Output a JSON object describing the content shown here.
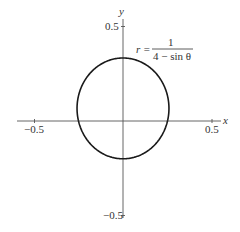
{
  "chart_data": {
    "type": "line",
    "subtype": "polar-curve",
    "title": "",
    "equation": {
      "lhs": "r =",
      "numerator": "1",
      "denominator": "4 − sin θ"
    },
    "xlabel": "x",
    "ylabel": "y",
    "xlim": [
      -0.6,
      0.55
    ],
    "ylim": [
      -0.52,
      0.55
    ],
    "x_ticks": [
      {
        "value": -0.5,
        "label": "−0.5"
      },
      {
        "value": 0.5,
        "label": "0.5"
      }
    ],
    "y_ticks": [
      {
        "value": 0.5,
        "label": "0.5"
      },
      {
        "value": -0.5,
        "label": "−0.5"
      }
    ],
    "grid": false,
    "legend": null,
    "series": [
      {
        "name": "r = 1/(4 − sin θ)",
        "color": "#1a1a1a",
        "key_points": [
          {
            "theta_deg": 0,
            "r": 0.25,
            "x": 0.25,
            "y": 0.0
          },
          {
            "theta_deg": 90,
            "r": 0.3333,
            "x": 0.0,
            "y": 0.3333
          },
          {
            "theta_deg": 180,
            "r": 0.25,
            "x": -0.25,
            "y": 0.0
          },
          {
            "theta_deg": 270,
            "r": 0.2,
            "x": 0.0,
            "y": -0.2
          }
        ]
      }
    ]
  },
  "axes": {
    "x_label": "x",
    "y_label": "y",
    "x_tick_neg": "−0.5",
    "x_tick_pos": "0.5",
    "y_tick_pos": "0.5",
    "y_tick_neg": "−0.5"
  },
  "colors": {
    "axis": "#555555",
    "curve": "#1a1a1a",
    "text": "#333333"
  }
}
